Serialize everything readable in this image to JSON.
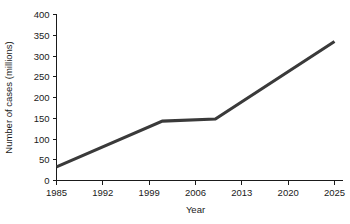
{
  "chart_data": {
    "type": "line",
    "title": "",
    "xlabel": "Year",
    "ylabel": "Number of cases (millions)",
    "xlim": [
      1985,
      2025
    ],
    "ylim": [
      0,
      400
    ],
    "grid": false,
    "legend": null,
    "xticks": [
      "1985",
      "1992",
      "1999",
      "2006",
      "2013",
      "2020",
      "2025"
    ],
    "xtick_values": [
      1985,
      1992,
      1999,
      2006,
      2013,
      2020,
      2025
    ],
    "yticks": [
      "0",
      "50",
      "100",
      "150",
      "200",
      "250",
      "300",
      "350",
      "400"
    ],
    "ytick_values": [
      0,
      50,
      100,
      150,
      200,
      250,
      300,
      350,
      400
    ],
    "series": [
      {
        "name": "Number of cases",
        "color": "#3a3a3a",
        "x": [
          1985,
          2001,
          2009,
          2025
        ],
        "values": [
          33,
          143,
          148,
          335
        ]
      }
    ]
  }
}
